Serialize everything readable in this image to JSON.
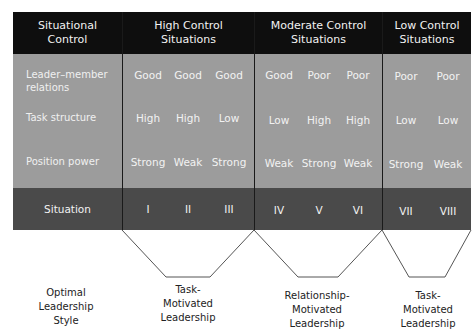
{
  "header": {
    "col0": "Situational Control",
    "col0_l1": "Situational",
    "col0_l2": "Control",
    "high_l1": "High Control",
    "high_l2": "Situations",
    "mod_l1": "Moderate Control",
    "mod_l2": "Situations",
    "low_l1": "Low Control",
    "low_l2": "Situations"
  },
  "rows": {
    "lmr_l1": "Leader–member",
    "lmr_l2": "relations",
    "task": "Task structure",
    "power": "Position power",
    "situation": "Situation"
  },
  "values": {
    "lmr": [
      "Good",
      "Good",
      "Good",
      "Good",
      "Poor",
      "Poor",
      "Poor",
      "Poor"
    ],
    "task": [
      "High",
      "High",
      "Low",
      "Low",
      "High",
      "High",
      "Low",
      "Low"
    ],
    "power": [
      "Strong",
      "Weak",
      "Strong",
      "Weak",
      "Strong",
      "Weak",
      "Strong",
      "Weak"
    ],
    "situation": [
      "I",
      "II",
      "III",
      "IV",
      "V",
      "VI",
      "VII",
      "VIII"
    ]
  },
  "styles": {
    "label_l1": "Optimal",
    "label_l2": "Leadership",
    "label_l3": "Style",
    "a_l1": "Task-",
    "a_l2": "Motivated",
    "a_l3": "Leadership",
    "b_l1": "Relationship-",
    "b_l2": "Motivated",
    "b_l3": "Leadership",
    "c_l1": "Task-",
    "c_l2": "Motivated",
    "c_l3": "Leadership"
  },
  "colors": {
    "header_bg": "#0e0e0e",
    "body_bg": "#9c9c9c",
    "situation_bg": "#4a4a4a"
  }
}
